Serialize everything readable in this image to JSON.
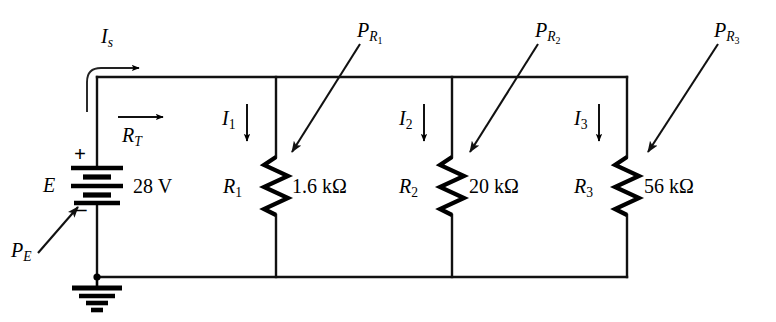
{
  "figure": {
    "type": "electrical-schematic",
    "background_color": "#ffffff",
    "line_color": "#000000"
  },
  "source": {
    "symbol": "battery",
    "name_label": "E",
    "value_label": "28 V",
    "polarity_plus": "+",
    "polarity_minus": "–",
    "power_label_base": "P",
    "power_label_sub": "E"
  },
  "ground": {
    "symbol": "earth-ground"
  },
  "currents": [
    {
      "base": "I",
      "sub": "s",
      "label": "Is",
      "direction": "right"
    },
    {
      "base": "I",
      "sub": "1",
      "label": "I1",
      "direction": "down"
    },
    {
      "base": "I",
      "sub": "2",
      "label": "I2",
      "direction": "down"
    },
    {
      "base": "I",
      "sub": "3",
      "label": "I3",
      "direction": "down"
    }
  ],
  "total_resistance": {
    "base": "R",
    "sub": "T",
    "label": "RT",
    "direction": "right"
  },
  "resistors": [
    {
      "name_base": "R",
      "name_sub": "1",
      "name": "R1",
      "value": "1.6 kΩ",
      "current_base": "I",
      "current_sub": "1",
      "power_base": "P",
      "power_sub": "R1",
      "power_sub_base": "R",
      "power_sub_sub": "1"
    },
    {
      "name_base": "R",
      "name_sub": "2",
      "name": "R2",
      "value": "20 kΩ",
      "current_base": "I",
      "current_sub": "2",
      "power_base": "P",
      "power_sub": "R2",
      "power_sub_base": "R",
      "power_sub_sub": "2"
    },
    {
      "name_base": "R",
      "name_sub": "3",
      "name": "R3",
      "value": "56 kΩ",
      "current_base": "I",
      "current_sub": "3",
      "power_base": "P",
      "power_sub": "R3",
      "power_sub_base": "R",
      "power_sub_sub": "3"
    }
  ]
}
